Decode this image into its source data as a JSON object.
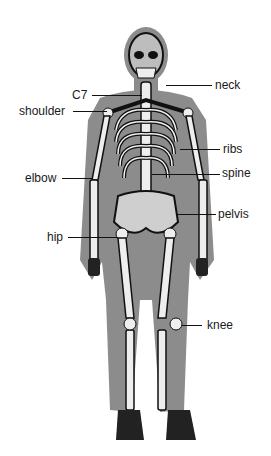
{
  "diagram": {
    "title": "",
    "colors": {
      "background": "#ffffff",
      "body_silhouette": "#8c8c8c",
      "bone": "#f2f2f2",
      "bone_outline": "#111111",
      "text": "#1a1a1a"
    },
    "labels": [
      {
        "id": "neck",
        "text": "neck",
        "side": "right"
      },
      {
        "id": "c7",
        "text": "C7",
        "side": "left"
      },
      {
        "id": "shoulder",
        "text": "shoulder",
        "side": "left"
      },
      {
        "id": "ribs",
        "text": "ribs",
        "side": "right"
      },
      {
        "id": "elbow",
        "text": "elbow",
        "side": "left"
      },
      {
        "id": "spine",
        "text": "spine",
        "side": "right"
      },
      {
        "id": "pelvis",
        "text": "pelvis",
        "side": "right"
      },
      {
        "id": "hip",
        "text": "hip",
        "side": "left"
      },
      {
        "id": "knee",
        "text": "knee",
        "side": "right"
      }
    ]
  }
}
